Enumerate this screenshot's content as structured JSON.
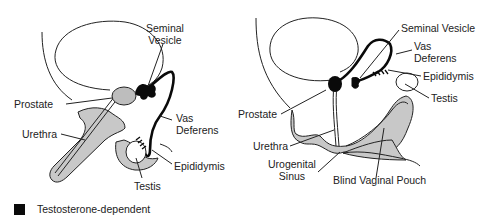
{
  "colors": {
    "gland_gray": "#bdbdbd",
    "tissue_gray": "#c8c8c8",
    "dependent_black": "#0a0a0a",
    "line": "#222222"
  },
  "left_diagram": {
    "labels": {
      "seminal_vesicle": "Seminal Vesicle",
      "seminal_vesicle_l1": "Seminal",
      "seminal_vesicle_l2": "Vesicle",
      "prostate": "Prostate",
      "urethra": "Urethra",
      "vas_deferens_l1": "Vas",
      "vas_deferens_l2": "Deferens",
      "epididymis": "Epididymis",
      "testis": "Testis"
    }
  },
  "right_diagram": {
    "labels": {
      "seminal_vesicle": "Seminal Vesicle",
      "vas_deferens_l1": "Vas",
      "vas_deferens_l2": "Deferens",
      "epididymis": "Epididymis",
      "testis": "Testis",
      "prostate": "Prostate",
      "urethra": "Urethra",
      "urogenital_sinus_l1": "Urogenital",
      "urogenital_sinus_l2": "Sinus",
      "blind_vaginal_pouch": "Blind Vaginal Pouch"
    }
  },
  "legend": {
    "label": "Testosterone-dependent",
    "icon": "black-square"
  }
}
